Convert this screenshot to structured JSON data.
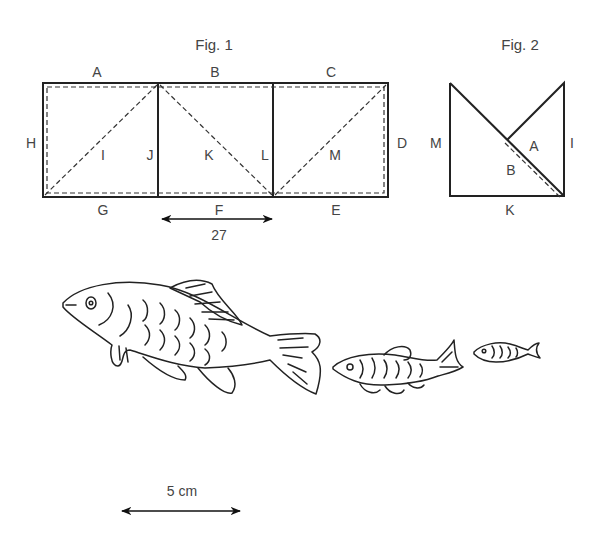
{
  "fig1": {
    "title": "Fig. 1",
    "labels": {
      "A": "A",
      "B": "B",
      "C": "C",
      "D": "D",
      "E": "E",
      "F": "F",
      "G": "G",
      "H": "H",
      "I": "I",
      "J": "J",
      "K": "K",
      "L": "L",
      "M": "M"
    },
    "dimension": "27"
  },
  "fig2": {
    "title": "Fig. 2",
    "labels": {
      "M": "M",
      "A": "A",
      "B": "B",
      "I": "I",
      "K": "K"
    }
  },
  "fish": {
    "count": 3,
    "sizes": [
      "large",
      "medium",
      "small"
    ]
  },
  "scale_bar": {
    "label": "5 cm"
  }
}
